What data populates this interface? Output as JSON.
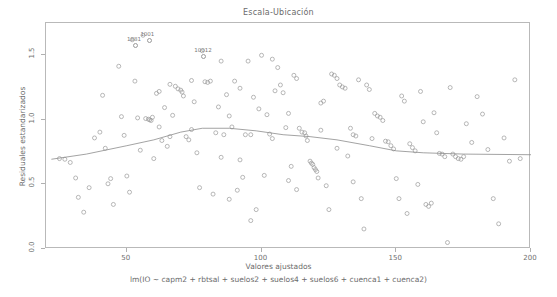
{
  "chart_data": {
    "type": "scatter",
    "title": "Escala-Ubicación",
    "xlabel": "Valores ajustados",
    "sublabel": "lm(IO ~ capm2 + rbtsal + suelos2 + suelos4 + suelos6 + cuenca1 + cuenca2)",
    "ylabel": "Residuales estandarizados",
    "xlim": [
      20,
      200
    ],
    "ylim": [
      0.0,
      1.75
    ],
    "xticks": [
      50,
      100,
      150,
      200
    ],
    "xtick_labels": [
      "50",
      "100",
      "150",
      "200"
    ],
    "yticks": [
      0.0,
      0.5,
      1.0,
      1.5
    ],
    "ytick_labels": [
      "0.0",
      "0.5",
      "1.0",
      "1.5"
    ],
    "grid": false,
    "legend": null,
    "marker": "open-circle",
    "point_color": "#9a9a9a",
    "line_color": "#8c8c8c",
    "frame_color": "#b9b9b9",
    "annotations": [
      {
        "label": "1001",
        "x": 58,
        "y": 1.655
      },
      {
        "label": "1881",
        "x": 53,
        "y": 1.615
      },
      {
        "label": "10012",
        "x": 78,
        "y": 1.535
      }
    ],
    "points": [
      {
        "x": 25,
        "y": 0.7
      },
      {
        "x": 27,
        "y": 0.695
      },
      {
        "x": 29,
        "y": 0.67
      },
      {
        "x": 31,
        "y": 0.55
      },
      {
        "x": 32,
        "y": 0.4
      },
      {
        "x": 34,
        "y": 0.285
      },
      {
        "x": 36,
        "y": 0.475
      },
      {
        "x": 38,
        "y": 0.86
      },
      {
        "x": 40,
        "y": 0.905
      },
      {
        "x": 41,
        "y": 1.19
      },
      {
        "x": 42,
        "y": 0.78
      },
      {
        "x": 43,
        "y": 0.505
      },
      {
        "x": 44,
        "y": 0.545
      },
      {
        "x": 45,
        "y": 0.345
      },
      {
        "x": 47,
        "y": 1.415
      },
      {
        "x": 48,
        "y": 1.025
      },
      {
        "x": 49,
        "y": 0.88
      },
      {
        "x": 50,
        "y": 0.565
      },
      {
        "x": 51,
        "y": 0.44
      },
      {
        "x": 52,
        "y": 1.62
      },
      {
        "x": 53,
        "y": 1.3
      },
      {
        "x": 54,
        "y": 1.015
      },
      {
        "x": 55,
        "y": 0.765
      },
      {
        "x": 56,
        "y": 1.655
      },
      {
        "x": 57,
        "y": 1.01
      },
      {
        "x": 58,
        "y": 1.005
      },
      {
        "x": 58.5,
        "y": 1.0
      },
      {
        "x": 59,
        "y": 0.995
      },
      {
        "x": 59.5,
        "y": 1.02
      },
      {
        "x": 60,
        "y": 0.7
      },
      {
        "x": 61,
        "y": 1.205
      },
      {
        "x": 62,
        "y": 1.22
      },
      {
        "x": 63,
        "y": 0.84
      },
      {
        "x": 64,
        "y": 1.095
      },
      {
        "x": 65,
        "y": 0.795
      },
      {
        "x": 66,
        "y": 0.87
      },
      {
        "x": 67,
        "y": 1.035
      },
      {
        "x": 68,
        "y": 1.26
      },
      {
        "x": 69,
        "y": 1.24
      },
      {
        "x": 70,
        "y": 1.23
      },
      {
        "x": 70.5,
        "y": 1.215
      },
      {
        "x": 71,
        "y": 1.185
      },
      {
        "x": 72,
        "y": 0.87
      },
      {
        "x": 73,
        "y": 0.845
      },
      {
        "x": 74,
        "y": 0.925
      },
      {
        "x": 75,
        "y": 1.14
      },
      {
        "x": 76,
        "y": 0.745
      },
      {
        "x": 77,
        "y": 0.475
      },
      {
        "x": 78,
        "y": 1.535
      },
      {
        "x": 79,
        "y": 1.295
      },
      {
        "x": 80,
        "y": 1.29
      },
      {
        "x": 81,
        "y": 1.3
      },
      {
        "x": 82,
        "y": 0.425
      },
      {
        "x": 83,
        "y": 0.9
      },
      {
        "x": 84,
        "y": 1.1
      },
      {
        "x": 85,
        "y": 1.455
      },
      {
        "x": 86,
        "y": 0.885
      },
      {
        "x": 87,
        "y": 1.195
      },
      {
        "x": 88,
        "y": 0.385
      },
      {
        "x": 89,
        "y": 0.945
      },
      {
        "x": 90,
        "y": 1.3
      },
      {
        "x": 91,
        "y": 0.455
      },
      {
        "x": 92,
        "y": 1.245
      },
      {
        "x": 93,
        "y": 0.555
      },
      {
        "x": 94,
        "y": 0.885
      },
      {
        "x": 95,
        "y": 1.455
      },
      {
        "x": 96,
        "y": 0.22
      },
      {
        "x": 97,
        "y": 1.175
      },
      {
        "x": 98,
        "y": 0.305
      },
      {
        "x": 99,
        "y": 1.085
      },
      {
        "x": 100,
        "y": 1.5
      },
      {
        "x": 101,
        "y": 0.57
      },
      {
        "x": 102,
        "y": 1.04
      },
      {
        "x": 103,
        "y": 0.89
      },
      {
        "x": 104,
        "y": 0.855
      },
      {
        "x": 105,
        "y": 1.225
      },
      {
        "x": 106,
        "y": 1.405
      },
      {
        "x": 107,
        "y": 1.27
      },
      {
        "x": 108,
        "y": 1.21
      },
      {
        "x": 109,
        "y": 0.94
      },
      {
        "x": 110,
        "y": 0.53
      },
      {
        "x": 111,
        "y": 0.64
      },
      {
        "x": 112,
        "y": 1.345
      },
      {
        "x": 113,
        "y": 1.32
      },
      {
        "x": 114,
        "y": 0.935
      },
      {
        "x": 115,
        "y": 0.905
      },
      {
        "x": 116,
        "y": 0.9
      },
      {
        "x": 116.5,
        "y": 0.875
      },
      {
        "x": 117,
        "y": 0.84
      },
      {
        "x": 118,
        "y": 0.68
      },
      {
        "x": 118.5,
        "y": 0.665
      },
      {
        "x": 119,
        "y": 0.655
      },
      {
        "x": 119.5,
        "y": 0.63
      },
      {
        "x": 120,
        "y": 0.615
      },
      {
        "x": 120.5,
        "y": 0.6
      },
      {
        "x": 121,
        "y": 0.55
      },
      {
        "x": 122,
        "y": 1.13
      },
      {
        "x": 123,
        "y": 1.145
      },
      {
        "x": 124,
        "y": 0.49
      },
      {
        "x": 125,
        "y": 0.305
      },
      {
        "x": 126,
        "y": 1.355
      },
      {
        "x": 127,
        "y": 1.345
      },
      {
        "x": 128,
        "y": 1.32
      },
      {
        "x": 129,
        "y": 1.27
      },
      {
        "x": 130,
        "y": 1.255
      },
      {
        "x": 131,
        "y": 1.245
      },
      {
        "x": 132,
        "y": 0.72
      },
      {
        "x": 133,
        "y": 0.935
      },
      {
        "x": 134,
        "y": 0.885
      },
      {
        "x": 135,
        "y": 0.875
      },
      {
        "x": 136,
        "y": 1.31
      },
      {
        "x": 137,
        "y": 0.39
      },
      {
        "x": 138,
        "y": 0.155
      },
      {
        "x": 139,
        "y": 1.27
      },
      {
        "x": 140,
        "y": 1.235
      },
      {
        "x": 141,
        "y": 0.855
      },
      {
        "x": 142,
        "y": 1.05
      },
      {
        "x": 143,
        "y": 1.03
      },
      {
        "x": 144,
        "y": 1.02
      },
      {
        "x": 145,
        "y": 0.995
      },
      {
        "x": 146,
        "y": 0.835
      },
      {
        "x": 147,
        "y": 0.83
      },
      {
        "x": 148,
        "y": 0.8
      },
      {
        "x": 149,
        "y": 0.775
      },
      {
        "x": 150,
        "y": 0.545
      },
      {
        "x": 151,
        "y": 0.39
      },
      {
        "x": 152,
        "y": 1.185
      },
      {
        "x": 153,
        "y": 1.145
      },
      {
        "x": 154,
        "y": 0.275
      },
      {
        "x": 155,
        "y": 0.815
      },
      {
        "x": 156,
        "y": 0.785
      },
      {
        "x": 157,
        "y": 0.76
      },
      {
        "x": 158,
        "y": 0.5
      },
      {
        "x": 159,
        "y": 1.22
      },
      {
        "x": 160,
        "y": 0.985
      },
      {
        "x": 161,
        "y": 0.345
      },
      {
        "x": 162,
        "y": 0.33
      },
      {
        "x": 163,
        "y": 0.355
      },
      {
        "x": 164,
        "y": 1.055
      },
      {
        "x": 165,
        "y": 0.9
      },
      {
        "x": 166,
        "y": 0.74
      },
      {
        "x": 167,
        "y": 0.735
      },
      {
        "x": 168,
        "y": 0.715
      },
      {
        "x": 169,
        "y": 0.05
      },
      {
        "x": 170,
        "y": 1.25
      },
      {
        "x": 171,
        "y": 0.735
      },
      {
        "x": 172,
        "y": 0.715
      },
      {
        "x": 173,
        "y": 0.7
      },
      {
        "x": 174,
        "y": 0.695
      },
      {
        "x": 175,
        "y": 0.715
      },
      {
        "x": 176,
        "y": 0.97
      },
      {
        "x": 178,
        "y": 0.825
      },
      {
        "x": 180,
        "y": 1.18
      },
      {
        "x": 182,
        "y": 1.045
      },
      {
        "x": 184,
        "y": 0.77
      },
      {
        "x": 186,
        "y": 0.39
      },
      {
        "x": 188,
        "y": 0.195
      },
      {
        "x": 190,
        "y": 0.86
      },
      {
        "x": 192,
        "y": 0.68
      },
      {
        "x": 194,
        "y": 1.31
      },
      {
        "x": 196,
        "y": 0.7
      },
      {
        "x": 85,
        "y": 0.71
      },
      {
        "x": 88,
        "y": 1.03
      },
      {
        "x": 92,
        "y": 0.69
      },
      {
        "x": 96,
        "y": 0.885
      },
      {
        "x": 104,
        "y": 1.47
      },
      {
        "x": 110,
        "y": 1.05
      },
      {
        "x": 113,
        "y": 0.46
      },
      {
        "x": 122,
        "y": 0.92
      },
      {
        "x": 128,
        "y": 0.78
      },
      {
        "x": 134,
        "y": 0.52
      },
      {
        "x": 66,
        "y": 1.275
      },
      {
        "x": 74,
        "y": 1.305
      },
      {
        "x": 62,
        "y": 0.945
      }
    ],
    "smooth_curve": [
      {
        "x": 22,
        "y": 0.695
      },
      {
        "x": 35,
        "y": 0.735
      },
      {
        "x": 50,
        "y": 0.8
      },
      {
        "x": 60,
        "y": 0.845
      },
      {
        "x": 70,
        "y": 0.905
      },
      {
        "x": 78,
        "y": 0.935
      },
      {
        "x": 88,
        "y": 0.935
      },
      {
        "x": 98,
        "y": 0.915
      },
      {
        "x": 108,
        "y": 0.885
      },
      {
        "x": 118,
        "y": 0.87
      },
      {
        "x": 128,
        "y": 0.845
      },
      {
        "x": 140,
        "y": 0.8
      },
      {
        "x": 150,
        "y": 0.76
      },
      {
        "x": 160,
        "y": 0.745
      },
      {
        "x": 175,
        "y": 0.735
      },
      {
        "x": 200,
        "y": 0.73
      }
    ]
  }
}
